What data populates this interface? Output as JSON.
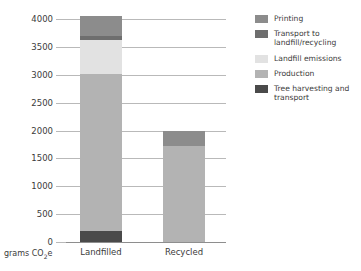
{
  "chart_data": {
    "type": "bar",
    "stacked": true,
    "title": "",
    "xlabel": "",
    "ylabel": "grams CO2e",
    "ylabel_html": "grams CO<sub>2</sub>e",
    "categories": [
      "Landfilled",
      "Recycled"
    ],
    "ylim": [
      0,
      4000
    ],
    "yticks": [
      0,
      500,
      1000,
      1500,
      2000,
      2500,
      3000,
      3500,
      4000
    ],
    "ytick_labels": [
      "0",
      "500",
      "1000",
      "1500",
      "2000",
      "2500",
      "3000",
      "3500",
      "4000"
    ],
    "grid": true,
    "grid_axis": "y",
    "legend_position": "right",
    "series": [
      {
        "name": "Printing",
        "color": "#8c8c8c",
        "values": [
          350,
          270
        ]
      },
      {
        "name": "Transport to landfill/recycling",
        "color": "#6e6e6e",
        "values": [
          80,
          0
        ]
      },
      {
        "name": "Landfill emissions",
        "color": "#e2e2e2",
        "values": [
          600,
          0
        ]
      },
      {
        "name": "Production",
        "color": "#b3b3b3",
        "values": [
          2820,
          1720
        ]
      },
      {
        "name": "Tree harvesting and transport",
        "color": "#4a4a4a",
        "values": [
          200,
          0
        ]
      }
    ],
    "stack_order_bottom_to_top": [
      "Tree harvesting and transport",
      "Production",
      "Landfill emissions",
      "Transport to landfill/recycling",
      "Printing"
    ],
    "totals": [
      4050,
      1990
    ]
  },
  "legend": {
    "items": [
      {
        "label": "Printing",
        "color": "#8c8c8c"
      },
      {
        "label": "Transport to landfill/recycling",
        "color": "#6e6e6e"
      },
      {
        "label": "Landfill emissions",
        "color": "#e2e2e2"
      },
      {
        "label": "Production",
        "color": "#b3b3b3"
      },
      {
        "label": "Tree harvesting and transport",
        "color": "#4a4a4a"
      }
    ]
  },
  "colors": {
    "grid": "#b9b9b9",
    "axis": "#8e8e8e",
    "text": "#3b3b3b",
    "background": "#ffffff"
  }
}
